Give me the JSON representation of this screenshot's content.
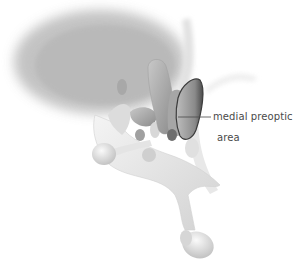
{
  "diagram": {
    "labels": [
      {
        "id": "medial-preoptic-area",
        "lines": [
          "medial preoptic",
          "area"
        ]
      }
    ],
    "colors": {
      "background": "#ffffff",
      "structure_light": "#e6e6e6",
      "structure_mid": "#b5b5b5",
      "structure_dark": "#6e6e6e",
      "highlight_outline": "#3c3c3c",
      "label_text": "#4a4a4a",
      "leader_line": "#4a4a4a"
    }
  }
}
